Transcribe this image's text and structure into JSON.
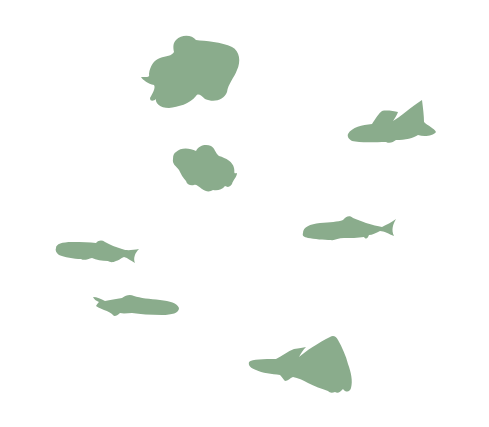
{
  "image": {
    "background": "#ffffff",
    "fish_color": "#8aac8c",
    "fish_count": 7
  },
  "fish": [
    {
      "kind": "fancy-goldfish-large"
    },
    {
      "kind": "guppy-top-right"
    },
    {
      "kind": "fancy-goldfish-small"
    },
    {
      "kind": "minnow-right"
    },
    {
      "kind": "minnow-left"
    },
    {
      "kind": "minnow-lower-left"
    },
    {
      "kind": "fancy-guppy-bottom"
    }
  ]
}
